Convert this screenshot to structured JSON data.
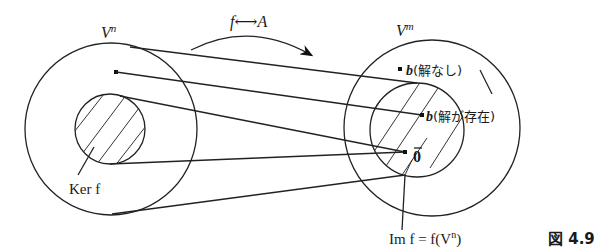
{
  "diagram": {
    "top_label": "f⟷A",
    "left_space": {
      "label_base": "V",
      "label_sup": "n"
    },
    "right_space": {
      "label_base": "V",
      "label_sup": "m"
    },
    "kernel_label": "Ker f",
    "image_label": "Im f = f(V",
    "image_label_sup": "n",
    "image_label_close": ")",
    "point_no_solution": {
      "symbol": "b",
      "text": "(解なし)"
    },
    "point_solution_exists": {
      "symbol": "b",
      "text": "(解が存在)"
    },
    "zero_label": "0",
    "figure_label": "図 4.9"
  }
}
